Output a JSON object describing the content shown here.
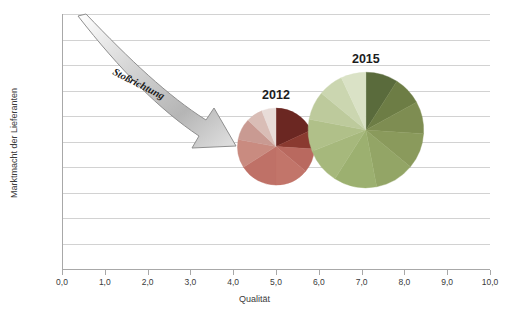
{
  "chart_data": {
    "type": "pie",
    "title": "",
    "xlabel": "Qualität",
    "ylabel": "Marktmacht der Lieferanten",
    "xlim": [
      0,
      10
    ],
    "ylim": [
      0,
      10
    ],
    "grid": true,
    "legend_position": "none",
    "x_ticks": [
      "0,0",
      "1,0",
      "2,0",
      "3,0",
      "4,0",
      "5,0",
      "6,0",
      "7,0",
      "8,0",
      "9,0",
      "10,0"
    ],
    "y_ticks": [
      "0,0",
      "1,0",
      "2,0",
      "3,0",
      "4,0",
      "5,0",
      "6,0",
      "7,0",
      "8,0",
      "9,0",
      "10,0"
    ],
    "annotations": [
      {
        "name": "arrow",
        "text": "Stoßrichtung",
        "from": [
          0.6,
          10.0
        ],
        "to": [
          4.1,
          5.0
        ],
        "style": "curved-block-arrow",
        "fill": "#c9c9c9"
      }
    ],
    "pies": [
      {
        "label": "2012",
        "center": [
          5.0,
          4.8
        ],
        "radius_units": 0.9,
        "label_color": "#1d1d1d",
        "slices": [
          {
            "value": 18,
            "color": "#6b2722"
          },
          {
            "value": 8,
            "color": "#8a3a30"
          },
          {
            "value": 10,
            "color": "#b9695f"
          },
          {
            "value": 14,
            "color": "#c2756a"
          },
          {
            "value": 16,
            "color": "#bf7167"
          },
          {
            "value": 12,
            "color": "#c98b80"
          },
          {
            "value": 9,
            "color": "#c99a92"
          },
          {
            "value": 7,
            "color": "#d9bdb6"
          },
          {
            "value": 6,
            "color": "#e8dcd8"
          }
        ]
      },
      {
        "label": "2015",
        "center": [
          7.1,
          5.45
        ],
        "radius_units": 1.35,
        "label_color": "#1d1d1d",
        "slices": [
          {
            "value": 9,
            "color": "#5a6b3c"
          },
          {
            "value": 8,
            "color": "#6d7d45"
          },
          {
            "value": 9,
            "color": "#7e8d52"
          },
          {
            "value": 10,
            "color": "#8a9a5c"
          },
          {
            "value": 11,
            "color": "#93a566"
          },
          {
            "value": 12,
            "color": "#9cb070"
          },
          {
            "value": 10,
            "color": "#a6b87c"
          },
          {
            "value": 9,
            "color": "#b0c089"
          },
          {
            "value": 8,
            "color": "#bdca9c"
          },
          {
            "value": 7,
            "color": "#cbd6b0"
          },
          {
            "value": 7,
            "color": "#dae2c6"
          }
        ]
      }
    ]
  },
  "axes": {
    "x_title": "Qualität",
    "y_title": "Marktmacht der Lieferanten",
    "x_ticks": [
      "0,0",
      "1,0",
      "2,0",
      "3,0",
      "4,0",
      "5,0",
      "6,0",
      "7,0",
      "8,0",
      "9,0",
      "10,0"
    ],
    "y_ticks": [
      "10,0",
      "9,0",
      "8,0",
      "7,0",
      "6,0",
      "5,0",
      "4,0",
      "3,0",
      "2,0",
      "1,0",
      "0,0"
    ]
  },
  "labels": {
    "pie_2012": "2012",
    "pie_2015": "2015",
    "arrow": "Stoßrichtung"
  },
  "colors": {
    "grid": "#d2d2d2",
    "axis": "#a8a8a8",
    "text": "#3a3a3a",
    "arrow_fill": "#c9c9c9",
    "pie_2012_dark": "#6b2722",
    "pie_2012_main": "#bf7167",
    "pie_2015_dark": "#5a6b3c",
    "pie_2015_main": "#9cb070"
  }
}
